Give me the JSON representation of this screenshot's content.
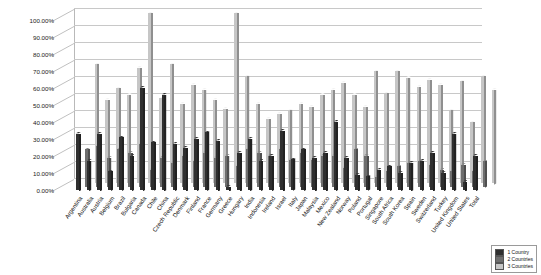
{
  "chart_data": {
    "type": "bar",
    "title": "",
    "subtitle": "",
    "xlabel": "",
    "ylabel": "",
    "ylim": [
      0,
      1.0
    ],
    "grid": true,
    "legend_position": "bottom-right",
    "ytick_labels": [
      "0.00%",
      "10.00%",
      "20.00%",
      "30.00%",
      "40.00%",
      "50.00%",
      "60.00%",
      "70.00%",
      "80.00%",
      "90.00%",
      "100.00%"
    ],
    "ytick_values": [
      0,
      0.1,
      0.2,
      0.3,
      0.4,
      0.5,
      0.6,
      0.7,
      0.8,
      0.9,
      1.0
    ],
    "categories": [
      "Argentina",
      "Australia",
      "Austria",
      "Belgium",
      "Brazil",
      "Bulgaria",
      "Canada",
      "Chile",
      "China",
      "Czech Republic",
      "Denmark",
      "Finland",
      "France",
      "Germany",
      "Greece",
      "Hungary",
      "India",
      "Indonesia",
      "Ireland",
      "Israel",
      "Italy",
      "Japan",
      "Malaysia",
      "Mexico",
      "New Zealand",
      "Norway",
      "Poland",
      "Portugal",
      "Singapore",
      "South Africa",
      "South Korea",
      "Spain",
      "Sweden",
      "Switzerland",
      "Turkey",
      "United Kingdom",
      "United States",
      "Total"
    ],
    "series": [
      {
        "name": "1 Country",
        "color": "#2f2f2f",
        "values": [
          0.33,
          0.17,
          0.33,
          0.11,
          0.31,
          0.2,
          0.6,
          0.28,
          0.56,
          0.27,
          0.25,
          0.3,
          0.34,
          0.29,
          0.02,
          0.22,
          0.3,
          0.17,
          0.2,
          0.35,
          0.18,
          0.24,
          0.19,
          0.22,
          0.4,
          0.19,
          0.09,
          0.08,
          0.12,
          0.14,
          0.1,
          0.16,
          0.17,
          0.22,
          0.1,
          0.33,
          0.05,
          0.2
        ]
      },
      {
        "name": "2 Countries",
        "color": "#6e6e6e",
        "values": [
          0.22,
          0.24,
          0.17,
          0.22,
          0.2,
          0.25,
          0.1,
          0.17,
          0.14,
          0.18,
          0.15,
          0.2,
          0.17,
          0.18,
          0.12,
          0.22,
          0.2,
          0.18,
          0.22,
          0.16,
          0.2,
          0.16,
          0.18,
          0.18,
          0.11,
          0.22,
          0.18,
          0.06,
          0.09,
          0.12,
          0.14,
          0.15,
          0.13,
          0.1,
          0.09,
          0.13,
          0.09,
          0.15
        ]
      },
      {
        "name": "3 Countries",
        "color": "#c6c6c6",
        "values": [
          0.7,
          0.49,
          0.56,
          0.52,
          0.68,
          1.0,
          0.5,
          0.7,
          0.47,
          0.58,
          0.55,
          0.49,
          0.44,
          1.0,
          0.63,
          0.47,
          0.38,
          0.41,
          0.43,
          0.47,
          0.45,
          0.52,
          0.55,
          0.59,
          0.52,
          0.45,
          0.66,
          0.53,
          0.66,
          0.62,
          0.57,
          0.61,
          0.58,
          0.43,
          0.6,
          0.36,
          0.63,
          0.55
        ]
      }
    ]
  },
  "legend": {
    "items": [
      {
        "label": "1 Country"
      },
      {
        "label": "2 Countries"
      },
      {
        "label": "3 Countries"
      }
    ]
  }
}
